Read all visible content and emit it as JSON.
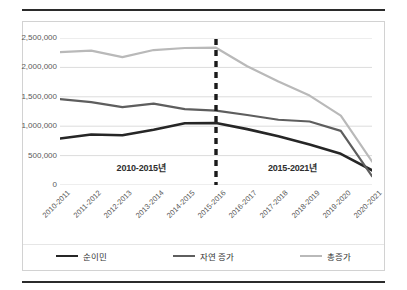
{
  "chart_data": {
    "type": "line",
    "title": "",
    "xlabel": "",
    "ylabel": "",
    "categories": [
      "2010-2011",
      "2011-2012",
      "2012-2013",
      "2013-2014",
      "2014-2015",
      "2015-2016",
      "2016-2017",
      "2017-2018",
      "2018-2019",
      "2019-2020",
      "2020-2021"
    ],
    "series": [
      {
        "name": "순이민",
        "color": "#262626",
        "width": 2.6,
        "values": [
          790000,
          860000,
          845000,
          940000,
          1050000,
          1055000,
          950000,
          830000,
          690000,
          530000,
          250000
        ]
      },
      {
        "name": "자연 증가",
        "color": "#5e5e5e",
        "width": 2.2,
        "values": [
          1460000,
          1410000,
          1325000,
          1385000,
          1290000,
          1265000,
          1190000,
          1110000,
          1080000,
          920000,
          150000
        ]
      },
      {
        "name": "총증가",
        "color": "#b9b9b9",
        "width": 2.2,
        "values": [
          2260000,
          2285000,
          2175000,
          2295000,
          2330000,
          2335000,
          2020000,
          1760000,
          1520000,
          1180000,
          400000
        ]
      }
    ],
    "ylim": [
      0,
      2500000
    ],
    "y_ticks": [
      0,
      500000,
      1000000,
      1500000,
      2000000,
      2500000
    ],
    "y_tick_labels": [
      "0",
      "500,000",
      "1,000,000",
      "1,500,000",
      "2,000,000",
      "2,500,000"
    ],
    "grid": true,
    "grid_color": "#dcdcdc",
    "legend_position": "bottom",
    "annotations": [
      {
        "text": "2010-2015년",
        "x_frac": 0.26,
        "y_value": 310000
      },
      {
        "text": "2015-2021년",
        "x_frac": 0.745,
        "y_value": 310000
      }
    ],
    "divider": {
      "label": "2015-2016 divider",
      "x_frac": 0.5,
      "style": "dashed",
      "color": "#1a1a1a"
    }
  },
  "legend": {
    "items": [
      {
        "label": "순이민",
        "color": "#262626",
        "width": 2.6
      },
      {
        "label": "자연 증가",
        "color": "#5e5e5e",
        "width": 2.2
      },
      {
        "label": "총증가",
        "color": "#b9b9b9",
        "width": 2.2
      }
    ]
  }
}
